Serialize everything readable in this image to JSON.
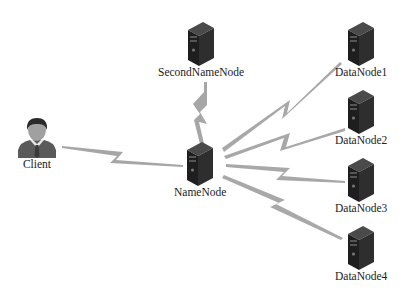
{
  "diagram": {
    "nodes": [
      {
        "id": "client",
        "label": "Client",
        "type": "user"
      },
      {
        "id": "namenode",
        "label": "NameNode",
        "type": "server"
      },
      {
        "id": "secondnamenode",
        "label": "SecondNameNode",
        "type": "server"
      },
      {
        "id": "datanode1",
        "label": "DataNode1",
        "type": "server"
      },
      {
        "id": "datanode2",
        "label": "DataNode2",
        "type": "server"
      },
      {
        "id": "datanode3",
        "label": "DataNode3",
        "type": "server"
      },
      {
        "id": "datanode4",
        "label": "DataNode4",
        "type": "server"
      }
    ],
    "edges": [
      {
        "from": "client",
        "to": "namenode",
        "style": "lightning"
      },
      {
        "from": "secondnamenode",
        "to": "namenode",
        "style": "lightning"
      },
      {
        "from": "namenode",
        "to": "datanode1",
        "style": "lightning"
      },
      {
        "from": "namenode",
        "to": "datanode2",
        "style": "lightning"
      },
      {
        "from": "namenode",
        "to": "datanode3",
        "style": "lightning"
      },
      {
        "from": "namenode",
        "to": "datanode4",
        "style": "lightning"
      }
    ],
    "colors": {
      "link": "#a8a8a8",
      "server_body": "#2a2a2a",
      "user_shirt": "#555555"
    }
  }
}
